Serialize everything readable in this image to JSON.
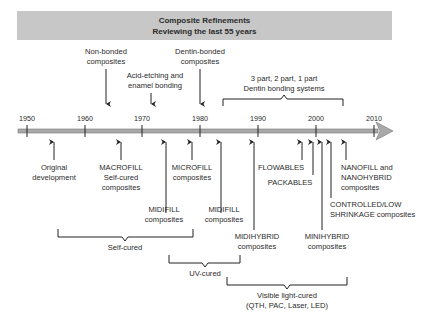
{
  "title": {
    "line1": "Composite Refinements",
    "line2": "Reviewing the last 55 years"
  },
  "timeline": {
    "years": [
      "1950",
      "1960",
      "1970",
      "1980",
      "1990",
      "2000",
      "2010"
    ]
  },
  "above_events": [
    {
      "line1": "Non-bonded",
      "line2": "composites",
      "year_approx": 1964
    },
    {
      "line1": "Acid-etching and",
      "line2": "enamel bonding",
      "year_approx": 1971
    },
    {
      "line1": "Dentin-bonded",
      "line2": "composites",
      "year_approx": 1980
    },
    {
      "line1": "3 part, 2 part, 1 part",
      "line2": "Dentin bonding systems",
      "range": "1983-2004"
    }
  ],
  "below_events": [
    {
      "line1": "Original",
      "line2": "development"
    },
    {
      "line1": "MACROFILL",
      "line2": "Self-cured",
      "line3": "composites"
    },
    {
      "line1": "MIDIFILL",
      "line2": "composites"
    },
    {
      "line1": "MICROFILL",
      "line2": "composites"
    },
    {
      "line1": "MIDIFILL",
      "line2": "composites"
    },
    {
      "line1": "MIDIHYBRID",
      "line2": "composites"
    },
    {
      "line1": "FLOWABLES"
    },
    {
      "line1": "PACKABLES"
    },
    {
      "line1": "MINIHYBRID",
      "line2": "composites"
    },
    {
      "line1": "CONTROLLED/LOW",
      "line2": "SHRINKAGE composites"
    },
    {
      "line1": "NANOFILL and",
      "line2": "NANOHYBRID",
      "line3": "composites"
    }
  ],
  "cure_ranges": [
    {
      "line1": "Self-cured"
    },
    {
      "line1": "UV-cured"
    },
    {
      "line1": "Visible light-cured",
      "line2": "(QTH, PAC, Laser, LED)"
    }
  ]
}
